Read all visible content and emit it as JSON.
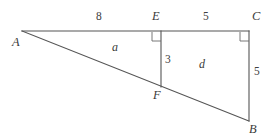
{
  "diagram": {
    "type": "geometry-figure",
    "canvas": {
      "width": 269,
      "height": 138,
      "background": "#ffffff"
    },
    "stroke_color": "#555555",
    "text_color": "#3a3a3a",
    "vertices": [
      {
        "id": "A",
        "label": "A",
        "x": 22,
        "y": 31,
        "label_x": 12,
        "label_y": 36
      },
      {
        "id": "E",
        "label": "E",
        "x": 161,
        "y": 31,
        "label_x": 152,
        "label_y": 10
      },
      {
        "id": "C",
        "label": "C",
        "x": 249,
        "y": 31,
        "label_x": 252,
        "label_y": 10
      },
      {
        "id": "F",
        "label": "F",
        "x": 161,
        "y": 87,
        "label_x": 153,
        "label_y": 89
      },
      {
        "id": "B",
        "label": "B",
        "x": 249,
        "y": 121,
        "label_x": 249,
        "label_y": 123
      }
    ],
    "segments": [
      {
        "id": "AC",
        "from": "A",
        "to": "C",
        "x1": 22,
        "y1": 31,
        "x2": 249,
        "y2": 31
      },
      {
        "id": "AB",
        "from": "A",
        "to": "B",
        "x1": 22,
        "y1": 31,
        "x2": 249,
        "y2": 121
      },
      {
        "id": "EF",
        "from": "E",
        "to": "F",
        "x1": 161,
        "y1": 31,
        "x2": 161,
        "y2": 87
      },
      {
        "id": "CB",
        "from": "C",
        "to": "B",
        "x1": 249,
        "y1": 31,
        "x2": 249,
        "y2": 121
      }
    ],
    "right_angles": [
      {
        "id": "angle-at-E",
        "at": "E",
        "x": 152,
        "y": 32,
        "size": 9
      },
      {
        "id": "angle-at-C",
        "at": "C",
        "x": 240,
        "y": 32,
        "size": 9
      }
    ],
    "measures": [
      {
        "id": "AE",
        "text": "8",
        "x": 96,
        "y": 11,
        "segment": "AE"
      },
      {
        "id": "EC",
        "text": "5",
        "x": 203,
        "y": 11,
        "segment": "EC"
      },
      {
        "id": "EF",
        "text": "3",
        "x": 165,
        "y": 54,
        "segment": "EF"
      },
      {
        "id": "CB",
        "text": "5",
        "x": 254,
        "y": 66,
        "segment": "CB"
      }
    ],
    "regions": [
      {
        "id": "region-a",
        "text": "a",
        "x": 112,
        "y": 41,
        "shape": "triangle AEF"
      },
      {
        "id": "region-d",
        "text": "d",
        "x": 199,
        "y": 58,
        "shape": "quadrilateral EFBC"
      }
    ]
  }
}
